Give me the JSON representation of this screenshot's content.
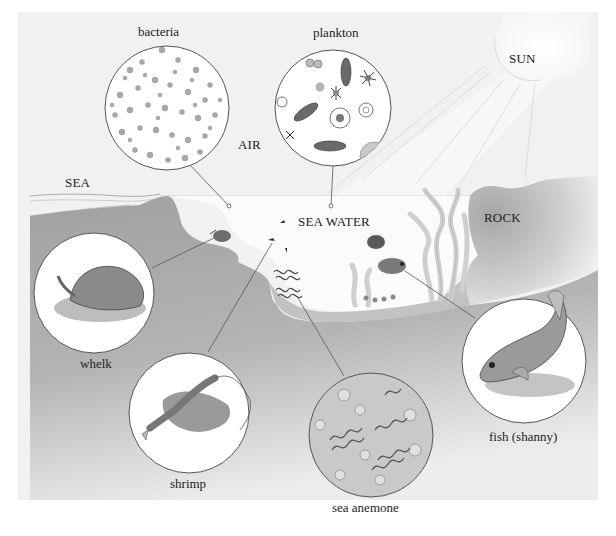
{
  "diagram": {
    "type": "rock-pool-ecosystem",
    "colors": {
      "page_bg": "#ffffff",
      "panel_bg": "#f1f1f1",
      "rock_dark": "#a3a3a3",
      "rock_light": "#e6e6e6",
      "water": "#fbfbfb",
      "outline": "#555555",
      "organism_fill": "#8e8e8e"
    },
    "regions": {
      "air": "AIR",
      "sea": "SEA",
      "sea_water": "SEA WATER",
      "rock": "ROCK",
      "sun": "SUN"
    },
    "insets": [
      {
        "id": "bacteria",
        "label": "bacteria"
      },
      {
        "id": "plankton",
        "label": "plankton"
      },
      {
        "id": "whelk",
        "label": "whelk"
      },
      {
        "id": "shrimp",
        "label": "shrimp"
      },
      {
        "id": "sea-anemone",
        "label": "sea anemone"
      },
      {
        "id": "fish",
        "label": "fish (shanny)"
      }
    ]
  }
}
